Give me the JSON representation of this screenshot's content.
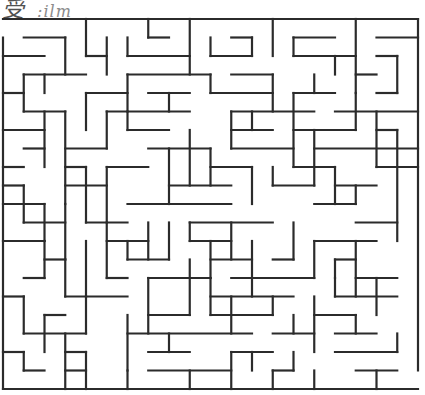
{
  "header": {
    "title_fragment_a": "受",
    "title_fragment_b": ":ilm"
  },
  "maze": {
    "cols": 20,
    "rows": 20,
    "origin": [
      3,
      19
    ],
    "cell": [
      20.75,
      18.5
    ],
    "color": "#2b2b2b",
    "entrance": "top-left, left side row 0",
    "exit": "bottom-right, right side row 19",
    "h": [
      [
        0,
        0,
        20
      ],
      [
        20,
        0,
        20
      ],
      [
        1,
        1,
        3
      ],
      [
        1,
        7,
        8
      ],
      [
        1,
        11,
        12
      ],
      [
        1,
        14,
        16
      ],
      [
        1,
        18,
        20
      ],
      [
        2,
        0,
        2
      ],
      [
        2,
        4,
        5
      ],
      [
        2,
        6,
        9
      ],
      [
        2,
        10,
        12
      ],
      [
        2,
        14,
        17
      ],
      [
        2,
        18,
        19
      ],
      [
        3,
        1,
        4
      ],
      [
        3,
        6,
        10
      ],
      [
        3,
        11,
        13
      ],
      [
        3,
        17,
        18
      ],
      [
        4,
        0,
        1
      ],
      [
        4,
        4,
        6
      ],
      [
        4,
        7,
        9
      ],
      [
        4,
        10,
        13
      ],
      [
        4,
        14,
        16
      ],
      [
        4,
        18,
        19
      ],
      [
        5,
        1,
        3
      ],
      [
        5,
        5,
        9
      ],
      [
        5,
        11,
        15
      ],
      [
        5,
        16,
        20
      ],
      [
        6,
        0,
        2
      ],
      [
        6,
        6,
        8
      ],
      [
        6,
        11,
        13
      ],
      [
        6,
        14,
        17
      ],
      [
        6,
        18,
        19
      ],
      [
        7,
        1,
        2
      ],
      [
        7,
        3,
        5
      ],
      [
        7,
        7,
        10
      ],
      [
        7,
        11,
        14
      ],
      [
        7,
        15,
        20
      ],
      [
        8,
        0,
        1
      ],
      [
        8,
        3,
        4
      ],
      [
        8,
        5,
        7
      ],
      [
        8,
        10,
        12
      ],
      [
        8,
        14,
        16
      ],
      [
        8,
        18,
        20
      ],
      [
        9,
        0,
        1
      ],
      [
        9,
        3,
        5
      ],
      [
        9,
        8,
        11
      ],
      [
        9,
        13,
        15
      ],
      [
        9,
        16,
        18
      ],
      [
        10,
        0,
        2
      ],
      [
        10,
        6,
        11
      ],
      [
        10,
        15,
        17
      ],
      [
        11,
        1,
        3
      ],
      [
        11,
        4,
        6
      ],
      [
        11,
        9,
        13
      ],
      [
        11,
        17,
        19
      ],
      [
        12,
        0,
        2
      ],
      [
        12,
        5,
        7
      ],
      [
        12,
        9,
        11
      ],
      [
        12,
        15,
        18
      ],
      [
        13,
        2,
        3
      ],
      [
        13,
        6,
        8
      ],
      [
        13,
        10,
        12
      ],
      [
        13,
        13,
        14
      ],
      [
        13,
        16,
        17
      ],
      [
        14,
        1,
        2
      ],
      [
        14,
        5,
        6
      ],
      [
        14,
        7,
        10
      ],
      [
        14,
        11,
        15
      ],
      [
        14,
        17,
        19
      ],
      [
        15,
        0,
        1
      ],
      [
        15,
        3,
        6
      ],
      [
        15,
        10,
        14
      ],
      [
        15,
        16,
        19
      ],
      [
        16,
        2,
        3
      ],
      [
        16,
        7,
        9
      ],
      [
        16,
        10,
        13
      ],
      [
        16,
        15,
        17
      ],
      [
        17,
        1,
        4
      ],
      [
        17,
        6,
        12
      ],
      [
        17,
        13,
        15
      ],
      [
        17,
        16,
        18
      ],
      [
        18,
        0,
        1
      ],
      [
        18,
        3,
        4
      ],
      [
        18,
        7,
        9
      ],
      [
        18,
        11,
        13
      ],
      [
        18,
        16,
        19
      ],
      [
        19,
        1,
        2
      ],
      [
        19,
        3,
        4
      ],
      [
        19,
        7,
        11
      ],
      [
        19,
        13,
        14
      ],
      [
        19,
        17,
        19
      ]
    ],
    "v": [
      [
        0,
        1,
        20
      ],
      [
        20,
        0,
        19
      ],
      [
        3,
        1,
        3
      ],
      [
        4,
        0,
        2
      ],
      [
        5,
        1,
        3
      ],
      [
        6,
        1,
        2
      ],
      [
        7,
        0,
        1
      ],
      [
        9,
        0,
        3
      ],
      [
        10,
        1,
        2
      ],
      [
        12,
        1,
        2
      ],
      [
        13,
        0,
        2
      ],
      [
        14,
        1,
        2
      ],
      [
        17,
        0,
        4
      ],
      [
        19,
        2,
        4
      ],
      [
        1,
        3,
        5
      ],
      [
        2,
        3,
        4
      ],
      [
        6,
        3,
        5
      ],
      [
        8,
        4,
        5
      ],
      [
        10,
        3,
        4
      ],
      [
        13,
        3,
        5
      ],
      [
        15,
        3,
        4
      ],
      [
        16,
        2,
        3
      ],
      [
        17,
        4,
        6
      ],
      [
        2,
        5,
        8
      ],
      [
        3,
        5,
        10
      ],
      [
        4,
        4,
        6
      ],
      [
        5,
        5,
        7
      ],
      [
        6,
        5,
        6
      ],
      [
        11,
        5,
        7
      ],
      [
        12,
        5,
        6
      ],
      [
        14,
        4,
        8
      ],
      [
        18,
        5,
        8
      ],
      [
        19,
        6,
        12
      ],
      [
        1,
        9,
        11
      ],
      [
        2,
        10,
        12
      ],
      [
        3,
        10,
        13
      ],
      [
        4,
        8,
        11
      ],
      [
        5,
        8,
        11
      ],
      [
        8,
        7,
        10
      ],
      [
        9,
        6,
        9
      ],
      [
        10,
        7,
        9
      ],
      [
        12,
        8,
        10
      ],
      [
        13,
        8,
        9
      ],
      [
        15,
        6,
        9
      ],
      [
        16,
        8,
        10
      ],
      [
        17,
        9,
        10
      ],
      [
        2,
        12,
        14
      ],
      [
        3,
        13,
        15
      ],
      [
        4,
        12,
        15
      ],
      [
        5,
        11,
        14
      ],
      [
        6,
        12,
        13
      ],
      [
        7,
        11,
        13
      ],
      [
        8,
        11,
        13
      ],
      [
        9,
        11,
        12
      ],
      [
        10,
        12,
        14
      ],
      [
        11,
        11,
        13
      ],
      [
        12,
        12,
        15
      ],
      [
        14,
        11,
        13
      ],
      [
        15,
        12,
        14
      ],
      [
        16,
        13,
        14
      ],
      [
        17,
        12,
        15
      ],
      [
        18,
        14,
        16
      ],
      [
        1,
        15,
        17
      ],
      [
        2,
        16,
        18
      ],
      [
        3,
        17,
        20
      ],
      [
        4,
        15,
        17
      ],
      [
        6,
        16,
        19
      ],
      [
        7,
        14,
        17
      ],
      [
        8,
        17,
        18
      ],
      [
        9,
        13,
        16
      ],
      [
        10,
        14,
        16
      ],
      [
        11,
        15,
        17
      ],
      [
        13,
        15,
        16
      ],
      [
        14,
        16,
        17
      ],
      [
        15,
        15,
        18
      ],
      [
        16,
        14,
        15
      ],
      [
        17,
        16,
        17
      ],
      [
        19,
        17,
        18
      ],
      [
        1,
        18,
        19
      ],
      [
        4,
        18,
        20
      ],
      [
        6,
        19,
        20
      ],
      [
        9,
        19,
        20
      ],
      [
        11,
        18,
        20
      ],
      [
        12,
        18,
        19
      ],
      [
        13,
        19,
        20
      ],
      [
        14,
        18,
        19
      ],
      [
        15,
        19,
        20
      ],
      [
        18,
        19,
        20
      ]
    ]
  }
}
